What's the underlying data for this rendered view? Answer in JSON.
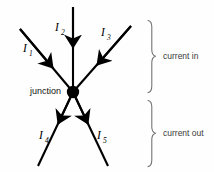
{
  "figure": {
    "background_color": "#fefefe",
    "line_color": "#000000",
    "label_color": "#3a3a3a",
    "junction": {
      "label": "junction",
      "cx": 73,
      "cy": 92,
      "r": 6.2
    },
    "currents": [
      {
        "id": "I1",
        "label": "I",
        "subscript": "1",
        "direction": "in",
        "from": [
          20,
          29
        ],
        "to": [
          73,
          92
        ],
        "label_x": 23,
        "label_y": 52
      },
      {
        "id": "I2",
        "label": "I",
        "subscript": "2",
        "direction": "in",
        "from": [
          73,
          7
        ],
        "to": [
          73,
          92
        ],
        "label_x": 55,
        "label_y": 31
      },
      {
        "id": "I3",
        "label": "I",
        "subscript": "3",
        "direction": "in",
        "from": [
          131,
          26
        ],
        "to": [
          73,
          92
        ],
        "label_x": 101,
        "label_y": 36
      },
      {
        "id": "I4",
        "label": "I",
        "subscript": "4",
        "direction": "out",
        "from": [
          73,
          92
        ],
        "to": [
          38,
          166
        ],
        "label_x": 39,
        "label_y": 139
      },
      {
        "id": "I5",
        "label": "I",
        "subscript": "5",
        "direction": "out",
        "from": [
          73,
          92
        ],
        "to": [
          108,
          166
        ],
        "label_x": 97,
        "label_y": 139
      }
    ],
    "braces": [
      {
        "id": "brace-in",
        "label": "current in",
        "top": 20,
        "bottom": 93,
        "x": 152,
        "label_x": 163,
        "label_y": 56
      },
      {
        "id": "brace-out",
        "label": "current out",
        "top": 100,
        "bottom": 167,
        "x": 152,
        "label_x": 163,
        "label_y": 133
      }
    ]
  }
}
